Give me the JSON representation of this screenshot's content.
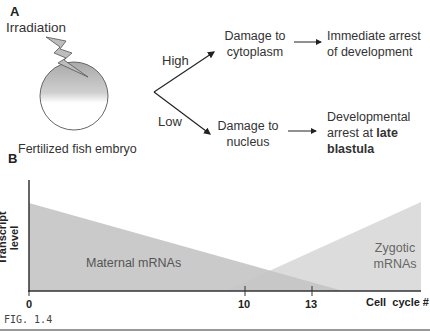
{
  "panel_a": {
    "label": "A",
    "irradiation": "Irradiation",
    "embryo_label": "Fertilized fish embryo",
    "branch_high": "High",
    "branch_low": "Low",
    "high_outcome_1": "Damage to",
    "high_outcome_2": "cytoplasm",
    "high_result_1": "Immediate arrest",
    "high_result_2": "of development",
    "low_outcome_1": "Damage to",
    "low_outcome_2": "nucleus",
    "low_result_1": "Developmental",
    "low_result_2a": "arrest at ",
    "low_result_2b": "late",
    "low_result_3": "blastula"
  },
  "panel_b": {
    "label": "B",
    "ylabel": "Transcript level",
    "xlabel": "Cell  cycle #",
    "maternal_label": "Maternal mRNAs",
    "zygotic_label_1": "Zygotic",
    "zygotic_label_2": "mRNAs",
    "ticks": [
      "0",
      "10",
      "13"
    ]
  },
  "caption": "FIG. 1.4",
  "colors": {
    "maternal_fill": "#c8c8c8",
    "zygotic_fill": "#dcdcdc",
    "overlap_fill": "#b8b8b8",
    "axis": "#333333"
  }
}
